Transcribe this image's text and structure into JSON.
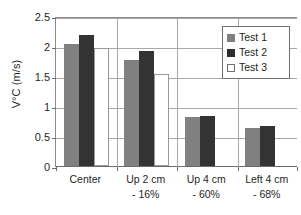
{
  "chart_data": {
    "type": "bar",
    "title": "",
    "subtitle": "",
    "xlabel": "",
    "ylabel": "V°C (m/s)",
    "ylim": [
      0,
      2.5
    ],
    "y_ticks": [
      "0",
      "0.5",
      "1",
      "1.5",
      "2",
      "2.5"
    ],
    "y_tick_values": [
      0,
      0.5,
      1,
      1.5,
      2,
      2.5
    ],
    "grid": true,
    "legend_position": "top-right-inside",
    "categories": [
      "Center",
      "Up 2 cm",
      "Up 4 cm",
      "Left 4 cm"
    ],
    "category_sublabels": [
      "",
      "- 16%",
      "- 60%",
      "- 68%"
    ],
    "series": [
      {
        "name": "Test 1",
        "color": "#808080",
        "values": [
          2.03,
          1.77,
          0.82,
          0.64
        ]
      },
      {
        "name": "Test 2",
        "color": "#333333",
        "values": [
          2.19,
          1.92,
          0.84,
          0.66
        ]
      },
      {
        "name": "Test 3",
        "color": "#ffffff",
        "values": [
          1.96,
          1.54,
          0,
          0
        ]
      }
    ]
  },
  "legend": {
    "entries": [
      {
        "label": "Test 1"
      },
      {
        "label": "Test 2"
      },
      {
        "label": "Test 3"
      }
    ]
  }
}
